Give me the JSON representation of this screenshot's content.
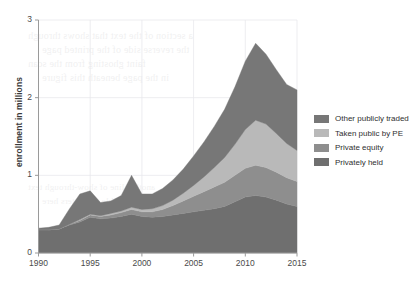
{
  "chart_data": {
    "type": "area",
    "stacked": true,
    "title": "",
    "xlabel": "",
    "ylabel": "enrollment in millions",
    "xlim": [
      1990,
      2015
    ],
    "ylim": [
      0,
      3
    ],
    "yticks": [
      0,
      1,
      2,
      3
    ],
    "xticks": [
      1990,
      1995,
      2000,
      2005,
      2010,
      2015
    ],
    "grid": true,
    "legend_position": "right",
    "x": [
      1990,
      1991,
      1992,
      1993,
      1994,
      1995,
      1996,
      1997,
      1998,
      1999,
      2000,
      2001,
      2002,
      2003,
      2004,
      2005,
      2006,
      2007,
      2008,
      2009,
      2010,
      2011,
      2012,
      2013,
      2014,
      2015
    ],
    "stack_order_bottom_to_top": [
      "Privately held",
      "Private equity",
      "Taken public by PE",
      "Other publicly traded"
    ],
    "series": [
      {
        "name": "Privately held",
        "color": "#6f6f6f",
        "values": [
          0.3,
          0.3,
          0.31,
          0.36,
          0.4,
          0.46,
          0.44,
          0.45,
          0.47,
          0.5,
          0.47,
          0.46,
          0.47,
          0.49,
          0.51,
          0.53,
          0.55,
          0.57,
          0.6,
          0.66,
          0.72,
          0.74,
          0.72,
          0.68,
          0.63,
          0.6
        ]
      },
      {
        "name": "Private equity",
        "color": "#8e8e8e",
        "values": [
          0.0,
          0.0,
          0.0,
          0.01,
          0.02,
          0.03,
          0.03,
          0.04,
          0.05,
          0.06,
          0.06,
          0.07,
          0.09,
          0.12,
          0.16,
          0.2,
          0.24,
          0.28,
          0.31,
          0.34,
          0.37,
          0.39,
          0.38,
          0.36,
          0.34,
          0.32
        ]
      },
      {
        "name": "Taken public by PE",
        "color": "#b9b9b9",
        "values": [
          0.0,
          0.0,
          0.0,
          0.0,
          0.01,
          0.01,
          0.01,
          0.02,
          0.02,
          0.03,
          0.03,
          0.04,
          0.05,
          0.07,
          0.1,
          0.14,
          0.19,
          0.25,
          0.32,
          0.4,
          0.5,
          0.58,
          0.56,
          0.5,
          0.44,
          0.4
        ]
      },
      {
        "name": "Other publicly traded",
        "color": "#777777",
        "values": [
          0.02,
          0.03,
          0.05,
          0.2,
          0.33,
          0.3,
          0.17,
          0.16,
          0.2,
          0.41,
          0.2,
          0.19,
          0.22,
          0.26,
          0.31,
          0.38,
          0.45,
          0.53,
          0.62,
          0.74,
          0.88,
          0.99,
          0.9,
          0.82,
          0.76,
          0.78
        ]
      }
    ],
    "totals": [
      0.32,
      0.33,
      0.36,
      0.57,
      0.76,
      0.8,
      0.65,
      0.67,
      0.74,
      1.0,
      0.76,
      0.76,
      0.83,
      0.94,
      1.08,
      1.25,
      1.43,
      1.63,
      1.85,
      2.14,
      2.47,
      2.7,
      2.56,
      2.36,
      2.17,
      2.1
    ]
  },
  "legend": {
    "items": [
      {
        "label": "Other publicly traded",
        "color": "#777777"
      },
      {
        "label": "Taken public by PE",
        "color": "#b9b9b9"
      },
      {
        "label": "Private equity",
        "color": "#8e8e8e"
      },
      {
        "label": "Privately held",
        "color": "#6f6f6f"
      }
    ]
  },
  "axes": {
    "ylabel": "enrollment in millions",
    "ytick_labels": [
      "0",
      "1",
      "2",
      "3"
    ],
    "xtick_labels": [
      "1990",
      "1995",
      "2000",
      "2005",
      "2010",
      "2015"
    ]
  },
  "background_bleed": {
    "lines": [
      "a section of the text that shows through",
      "the reverse side of the printed page",
      "faint ghosting from the scan",
      "in the page beneath this figure",
      "another line of show-through text",
      "partially legible characters here"
    ]
  }
}
